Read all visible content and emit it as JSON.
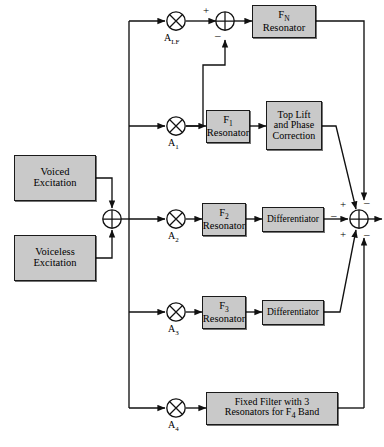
{
  "diagram": {
    "fill_color": "#c9c9c9",
    "stroke_color": "#1a1a1a",
    "background": "#ffffff",
    "sources": [
      {
        "id": "voiced",
        "label_line1": "Voiced",
        "label_line2": "Excitation"
      },
      {
        "id": "voiceless",
        "label_line1": "Voiceless",
        "label_line2": "Excitation"
      }
    ],
    "gains": [
      {
        "id": "alf",
        "label": "A",
        "sub": "LF"
      },
      {
        "id": "a1",
        "label": "A",
        "sub": "1"
      },
      {
        "id": "a2",
        "label": "A",
        "sub": "2"
      },
      {
        "id": "a3",
        "label": "A",
        "sub": "3"
      },
      {
        "id": "a4",
        "label": "A",
        "sub": "4"
      }
    ],
    "blocks": [
      {
        "id": "fn_res",
        "line1": "F",
        "sub1": "N",
        "line2": "Resonator"
      },
      {
        "id": "f1_res",
        "line1": "F",
        "sub1": "1",
        "line2": "Resonator"
      },
      {
        "id": "f2_res",
        "line1": "F",
        "sub1": "2",
        "line2": "Resonator"
      },
      {
        "id": "f3_res",
        "line1": "F",
        "sub1": "3",
        "line2": "Resonator"
      },
      {
        "id": "toplift",
        "line1": "Top Lift",
        "line2": "and Phase",
        "line3": "Correction"
      },
      {
        "id": "diff1",
        "line1": "Differentiator"
      },
      {
        "id": "diff2",
        "line1": "Differentiator"
      },
      {
        "id": "fixed",
        "line1": "Fixed Filter with 3",
        "line2": "Resonators for F",
        "sub2": "4",
        "line2b": " Band"
      }
    ],
    "adders": [
      {
        "id": "excitation-adder",
        "type": "sum"
      },
      {
        "id": "top-adder",
        "type": "sum",
        "signs": [
          "+",
          "-"
        ]
      },
      {
        "id": "output-adder",
        "type": "sum",
        "signs": [
          "+",
          "-",
          "+",
          "-",
          "-"
        ]
      }
    ],
    "signs": {
      "top_plus": "+",
      "top_minus": "–",
      "out_upper_plus": "+",
      "out_upper_minus": "–",
      "out_left_minus": "–",
      "out_lower_plus": "+",
      "out_lower_minus": "–"
    }
  }
}
